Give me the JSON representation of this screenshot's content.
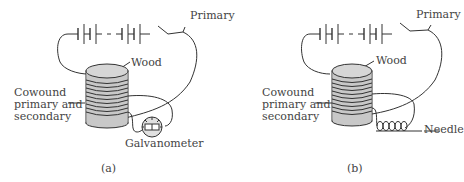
{
  "panels": [
    {
      "id": "a",
      "caption": "(a)",
      "labels": {
        "primary": "Primary",
        "wood": "Wood",
        "coil_line1": "Cowound",
        "coil_line2": "primary and",
        "coil_line3": "secondary",
        "instrument": "Galvanometer"
      }
    },
    {
      "id": "b",
      "caption": "(b)",
      "labels": {
        "primary": "Primary",
        "wood": "Wood",
        "coil_line1": "Cowound",
        "coil_line2": "primary and",
        "coil_line3": "secondary",
        "instrument": "Needle"
      }
    }
  ],
  "colors": {
    "line": "#333333",
    "core_fill": "#c8c8c8",
    "core_top": "#d6d6d6",
    "text": "#444444"
  }
}
